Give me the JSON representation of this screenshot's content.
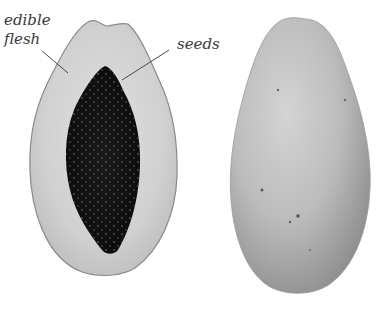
{
  "labels": {
    "flesh_line1": "edible",
    "flesh_line2": "flesh",
    "seeds": "seeds"
  },
  "subjects": [
    {
      "name": "halved-papaya",
      "description": "Papaya cut lengthwise showing pale flesh and dark seed cavity"
    },
    {
      "name": "whole-papaya",
      "description": "Whole elongated papaya with speckled skin"
    }
  ],
  "colors": {
    "background": "#ffffff",
    "flesh": "#cfcfcf",
    "flesh_light": "#dedede",
    "rind_outline": "#8a8a8a",
    "seeds": "#141414",
    "seed_highlight": "#6a6a6a",
    "whole_skin": "#b8b8b8",
    "whole_skin_light": "#d2d2d2",
    "leader_line": "#4a4a4a",
    "label_text": "#3a3a3a"
  }
}
